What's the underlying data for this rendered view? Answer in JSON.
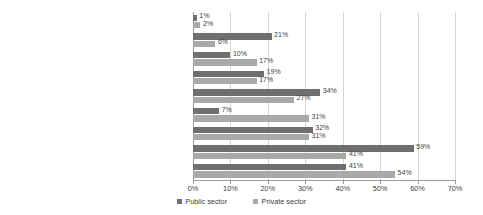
{
  "chart_data": {
    "type": "bar",
    "orientation": "horizontal",
    "title": "",
    "xlabel": "",
    "ylabel": "",
    "xlim": [
      0,
      70
    ],
    "xticks": [
      "0%",
      "10%",
      "20%",
      "30%",
      "40%",
      "50%",
      "60%",
      "70%"
    ],
    "xtick_values": [
      0,
      10,
      20,
      30,
      40,
      50,
      60,
      70
    ],
    "grid": true,
    "legend_position": "bottom",
    "value_suffix": "%",
    "categories": [
      "How old I am",
      "Based on a trades union negotiated deal",
      "Linked to my team/department performance",
      "Based on how long I have worked for my employer",
      "Linked to the going rate to that I do",
      "Linked to how my organisation performs",
      "Based on my experience",
      "Linked to inflation/cost of living",
      "Personal performance"
    ],
    "series": [
      {
        "name": "Public sector",
        "color": "#6f6f6f",
        "values": [
          1,
          21,
          10,
          19,
          34,
          7,
          32,
          59,
          41
        ],
        "labels": [
          "1%",
          "21%",
          "10%",
          "19%",
          "34%",
          "7%",
          "32%",
          "59%",
          "41%"
        ]
      },
      {
        "name": "Private sector",
        "color": "#a9a9a9",
        "values": [
          2,
          6,
          17,
          17,
          27,
          31,
          31,
          41,
          54
        ],
        "labels": [
          "2%",
          "6%",
          "17%",
          "17%",
          "27%",
          "31%",
          "31%",
          "41%",
          "54%"
        ]
      }
    ]
  }
}
